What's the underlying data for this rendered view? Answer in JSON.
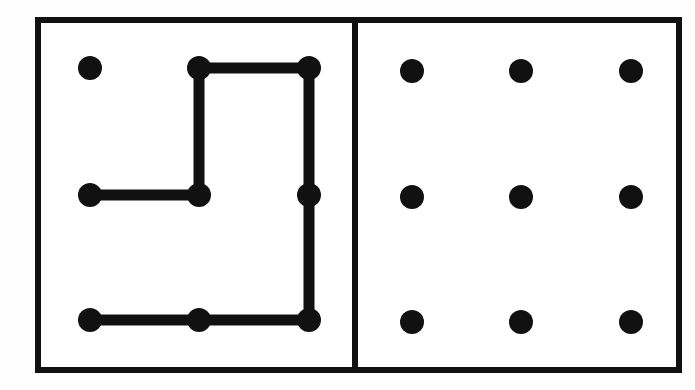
{
  "figure": {
    "background_color": "#fefefe",
    "ink_color": "#111111",
    "canvas": {
      "width": 695,
      "height": 390
    }
  },
  "frame": {
    "outer_rect": {
      "x": 35,
      "y": 17,
      "width": 647,
      "height": 356
    },
    "border_width": 6,
    "divider_x": 355,
    "divider_width": 6,
    "border_color": "#111111",
    "fill_color": "#ffffff"
  },
  "dot_style": {
    "radius": 12,
    "color": "#111111"
  },
  "line_style": {
    "width": 11,
    "color": "#111111",
    "cap": "round",
    "join": "round"
  },
  "panels": [
    {
      "name": "left-panel",
      "label": "Panel with polyline path",
      "bounds": {
        "x": 38,
        "y": 20,
        "width": 314,
        "height": 350
      },
      "dots": [
        {
          "id": "L-r1c1",
          "row": 1,
          "col": 1,
          "cx": 90,
          "cy": 68,
          "on_path": false
        },
        {
          "id": "L-r1c2",
          "row": 1,
          "col": 2,
          "cx": 199,
          "cy": 68,
          "on_path": true
        },
        {
          "id": "L-r1c3",
          "row": 1,
          "col": 3,
          "cx": 309,
          "cy": 68,
          "on_path": true
        },
        {
          "id": "L-r2c1",
          "row": 2,
          "col": 1,
          "cx": 90,
          "cy": 195,
          "on_path": true
        },
        {
          "id": "L-r2c2",
          "row": 2,
          "col": 2,
          "cx": 199,
          "cy": 195,
          "on_path": true
        },
        {
          "id": "L-r2c3",
          "row": 2,
          "col": 3,
          "cx": 309,
          "cy": 195,
          "on_path": true
        },
        {
          "id": "L-r3c1",
          "row": 3,
          "col": 1,
          "cx": 90,
          "cy": 320,
          "on_path": true
        },
        {
          "id": "L-r3c2",
          "row": 3,
          "col": 2,
          "cx": 199,
          "cy": 320,
          "on_path": true
        },
        {
          "id": "L-r3c3",
          "row": 3,
          "col": 3,
          "cx": 309,
          "cy": 320,
          "on_path": true
        }
      ],
      "path_points": [
        {
          "x": 90,
          "y": 195
        },
        {
          "x": 199,
          "y": 195
        },
        {
          "x": 199,
          "y": 68
        },
        {
          "x": 309,
          "y": 68
        },
        {
          "x": 309,
          "y": 195
        },
        {
          "x": 309,
          "y": 320
        },
        {
          "x": 199,
          "y": 320
        },
        {
          "x": 90,
          "y": 320
        }
      ],
      "path_d": "M 90 195 L 199 195 L 199 68 L 309 68 L 309 320 L 90 320"
    },
    {
      "name": "right-panel",
      "label": "Panel with plain nine-dot grid",
      "bounds": {
        "x": 358,
        "y": 20,
        "width": 321,
        "height": 350
      },
      "dots": [
        {
          "id": "R-r1c1",
          "row": 1,
          "col": 1,
          "cx": 412,
          "cy": 71,
          "on_path": false
        },
        {
          "id": "R-r1c2",
          "row": 1,
          "col": 2,
          "cx": 521,
          "cy": 71,
          "on_path": false
        },
        {
          "id": "R-r1c3",
          "row": 1,
          "col": 3,
          "cx": 631,
          "cy": 71,
          "on_path": false
        },
        {
          "id": "R-r2c1",
          "row": 2,
          "col": 1,
          "cx": 412,
          "cy": 197,
          "on_path": false
        },
        {
          "id": "R-r2c2",
          "row": 2,
          "col": 2,
          "cx": 521,
          "cy": 197,
          "on_path": false
        },
        {
          "id": "R-r2c3",
          "row": 2,
          "col": 3,
          "cx": 631,
          "cy": 197,
          "on_path": false
        },
        {
          "id": "R-r3c1",
          "row": 3,
          "col": 1,
          "cx": 412,
          "cy": 322,
          "on_path": false
        },
        {
          "id": "R-r3c2",
          "row": 3,
          "col": 2,
          "cx": 521,
          "cy": 322,
          "on_path": false
        },
        {
          "id": "R-r3c3",
          "row": 3,
          "col": 3,
          "cx": 631,
          "cy": 322,
          "on_path": false
        }
      ],
      "path_points": [],
      "path_d": ""
    }
  ]
}
